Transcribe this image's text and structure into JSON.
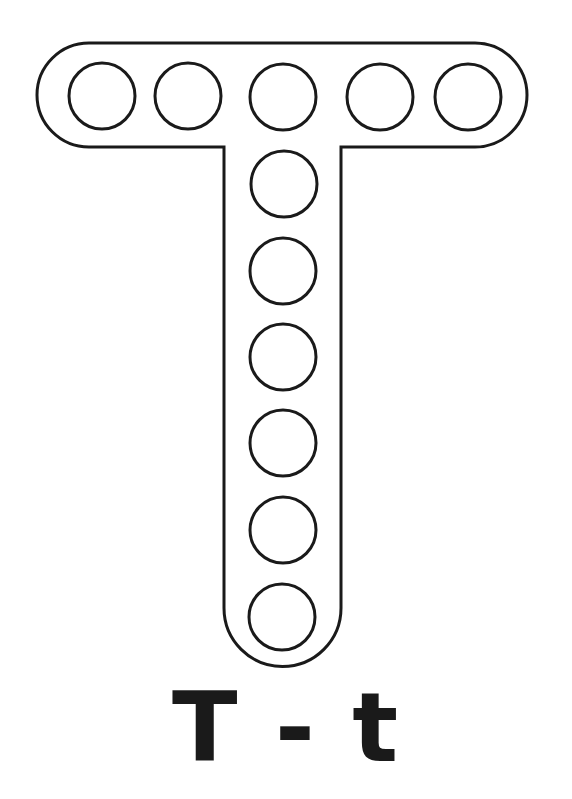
{
  "worksheet": {
    "letter_upper": "T",
    "separator": "-",
    "letter_lower": "t",
    "caption": "T - t",
    "dot_count": 11
  },
  "colors": {
    "background": "#ffffff",
    "stroke": "#1a1a1a"
  }
}
